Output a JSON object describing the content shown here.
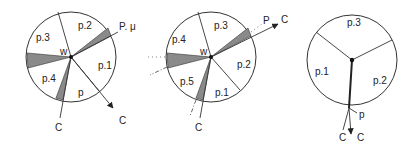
{
  "diagrams": [
    {
      "id": "left",
      "center_label": "w",
      "sectors": [
        "p.2",
        "p.3",
        "p.4",
        "p",
        "p.1"
      ],
      "labels": {
        "p2": "p.2",
        "p3": "p.3",
        "p4": "p.4",
        "p": "p",
        "p1": "p.1",
        "w": "w",
        "out_p": "P. μ",
        "c_bottom": "C",
        "c_arrow": "C"
      }
    },
    {
      "id": "middle",
      "center_label": "w",
      "sectors": [
        "p.3",
        "p.4",
        "p.5",
        "p.1",
        "p.2"
      ],
      "labels": {
        "p3": "p.3",
        "p4": "p.4",
        "p5": "p.5",
        "p1": "p.1",
        "p2": "p.2",
        "w": "w",
        "out_p": "P",
        "c_arrow": "C",
        "c_bottom": "C"
      }
    },
    {
      "id": "right",
      "sectors": [
        "p.3",
        "p.1",
        "p.2"
      ],
      "labels": {
        "p3": "p.3",
        "p1": "p.1",
        "p2": "p.2",
        "p": "p",
        "c_left": "C",
        "c_right": "C"
      }
    }
  ]
}
